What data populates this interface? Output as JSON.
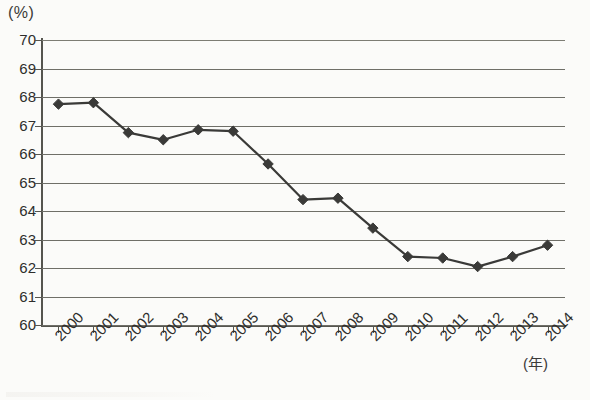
{
  "chart_data": {
    "type": "line",
    "title": "",
    "xlabel": "(年)",
    "ylabel": "(%)",
    "ylim": [
      60,
      70
    ],
    "ytick_step": 1,
    "grid": true,
    "legend": "none",
    "marker": "diamond",
    "line_color": "#3a3a38",
    "marker_color": "#3a3a38",
    "grid_color": "#6f6f68",
    "categories": [
      "2000",
      "2001",
      "2002",
      "2003",
      "2004",
      "2005",
      "2006",
      "2007",
      "2008",
      "2009",
      "2010",
      "2011",
      "2012",
      "2013",
      "2014"
    ],
    "values": [
      67.75,
      67.8,
      66.75,
      66.5,
      66.85,
      66.8,
      65.65,
      64.4,
      64.45,
      63.4,
      62.4,
      62.35,
      62.05,
      62.4,
      62.8
    ],
    "yticks": [
      "70",
      "69",
      "68",
      "67",
      "66",
      "65",
      "64",
      "63",
      "62",
      "61",
      "60"
    ],
    "series": [
      {
        "name": "",
        "values": [
          67.75,
          67.8,
          66.75,
          66.5,
          66.85,
          66.8,
          65.65,
          64.4,
          64.45,
          63.4,
          62.4,
          62.35,
          62.05,
          62.4,
          62.8
        ]
      }
    ]
  },
  "axis": {
    "unit_y": "(%)",
    "unit_x": "(年)"
  }
}
